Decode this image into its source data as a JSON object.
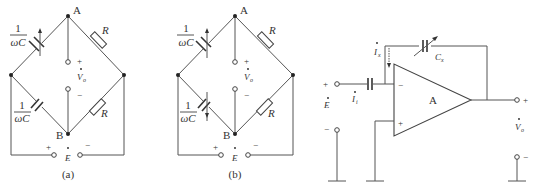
{
  "figure": {
    "panels": [
      {
        "id": "a",
        "caption": "(a)",
        "node_top": "A",
        "node_bottom": "B",
        "upper_left_element": {
          "label_num": "1",
          "label_den": "ωC",
          "type": "variable-capacitor"
        },
        "lower_left_element": {
          "label_num": "1",
          "label_den": "ωC",
          "type": "capacitor"
        },
        "upper_right_element": {
          "label": "R",
          "type": "resistor"
        },
        "lower_right_element": {
          "label": "R",
          "type": "resistor"
        },
        "output": {
          "symbol": "V",
          "subscript": "o",
          "plus": "+",
          "minus": "−"
        },
        "source": {
          "symbol": "E",
          "plus": "+",
          "minus": "−"
        }
      },
      {
        "id": "b",
        "caption": "(b)",
        "node_top": "A",
        "node_bottom": "B",
        "upper_left_element": {
          "label_num": "1",
          "label_den": "ωC",
          "type": "variable-capacitor"
        },
        "lower_left_element": {
          "label_num": "1",
          "label_den": "ωC",
          "type": "variable-capacitor"
        },
        "upper_right_element": {
          "label": "R",
          "type": "resistor"
        },
        "lower_right_element": {
          "label": "R",
          "type": "resistor"
        },
        "output": {
          "symbol": "V",
          "subscript": "o",
          "plus": "+",
          "minus": "−"
        },
        "source": {
          "symbol": "E",
          "plus": "+",
          "minus": "−"
        }
      }
    ],
    "opamp_circuit": {
      "amp_label": "A",
      "inverting": "−",
      "noninverting": "+",
      "input_current": {
        "symbol": "I",
        "subscript": "i"
      },
      "feedback_current": {
        "symbol": "I",
        "subscript": "x"
      },
      "feedback_cap": {
        "symbol": "C",
        "subscript": "x"
      },
      "source": {
        "symbol": "E",
        "plus": "+",
        "minus": "−"
      },
      "output": {
        "symbol": "V",
        "subscript": "o",
        "plus": "+",
        "minus": "−"
      }
    }
  }
}
